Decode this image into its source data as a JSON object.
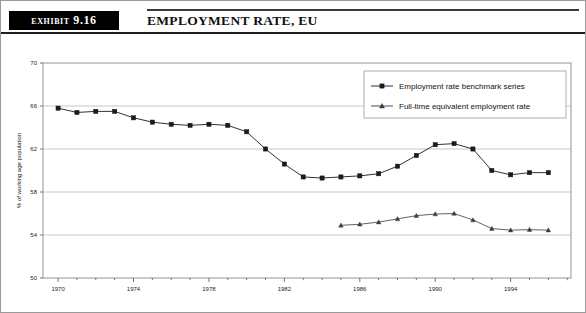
{
  "header": {
    "exhibit_label": "EXHIBIT 9.16",
    "title": "EMPLOYMENT RATE, EU"
  },
  "chart_data": {
    "type": "line",
    "title": "Employment Rate, EU",
    "xlabel": "",
    "ylabel": "% of working age population",
    "xlim": [
      1969.2,
      1997.2
    ],
    "ylim": [
      50,
      70
    ],
    "yticks": [
      50,
      54,
      58,
      62,
      66,
      70
    ],
    "xticks": [
      1970,
      1974,
      1978,
      1982,
      1986,
      1990,
      1994
    ],
    "xtick_labels": [
      "1970",
      "1974",
      "1978",
      "1982",
      "1986",
      "1990",
      "1994"
    ],
    "ytick_labels": [
      "50",
      "54",
      "58",
      "62",
      "66",
      "70"
    ],
    "x_minor_step": 1,
    "grid": "horizontal",
    "legend_position": "top-right",
    "colors": {
      "line": "#1a1a1a",
      "grid": "#b9b9b9",
      "frame": "#8a8a8a",
      "background": "#ffffff"
    },
    "series": [
      {
        "name": "Employment rate benchmark series",
        "marker": "square",
        "x": [
          1970,
          1971,
          1972,
          1973,
          1974,
          1975,
          1976,
          1977,
          1978,
          1979,
          1980,
          1981,
          1982,
          1983,
          1984,
          1985,
          1986,
          1987,
          1988,
          1989,
          1990,
          1991,
          1992,
          1993,
          1994,
          1995,
          1996
        ],
        "values": [
          65.8,
          65.4,
          65.5,
          65.5,
          64.9,
          64.5,
          64.3,
          64.2,
          64.3,
          64.2,
          63.6,
          62.0,
          60.6,
          59.4,
          59.3,
          59.4,
          59.5,
          59.7,
          60.4,
          61.4,
          62.4,
          62.5,
          62.0,
          60.0,
          59.6,
          59.8,
          59.8
        ],
        "last_value": 60.4
      },
      {
        "name": "Full-time equivalent employment rate",
        "marker": "triangle",
        "x": [
          1985,
          1986,
          1987,
          1988,
          1989,
          1990,
          1991,
          1992,
          1993,
          1994,
          1995,
          1996
        ],
        "values": [
          54.9,
          55.0,
          55.2,
          55.5,
          55.8,
          55.95,
          56.0,
          55.4,
          54.6,
          54.45,
          54.5,
          54.45
        ],
        "last_value": 54.4
      }
    ]
  },
  "legend": {
    "entries": [
      {
        "label": "Employment rate benchmark series",
        "marker": "square"
      },
      {
        "label": "Full-time equivalent employment rate",
        "marker": "triangle"
      }
    ]
  }
}
